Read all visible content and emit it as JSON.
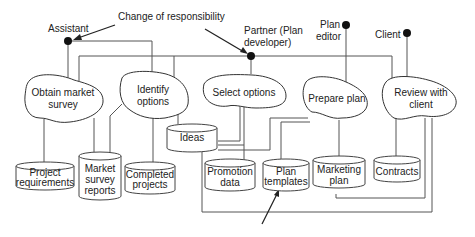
{
  "diagram": {
    "annotations": {
      "change_of_responsibility": "Change of responsibility"
    },
    "roles": [
      {
        "id": "assistant",
        "lines": [
          "Assistant"
        ]
      },
      {
        "id": "partner",
        "lines": [
          "Partner (Plan",
          "developer)"
        ]
      },
      {
        "id": "plan_editor",
        "lines": [
          "Plan",
          "editor"
        ]
      },
      {
        "id": "client",
        "lines": [
          "Client"
        ]
      }
    ],
    "activities": [
      {
        "id": "obtain_market_survey",
        "lines": [
          "Obtain market",
          "survey"
        ]
      },
      {
        "id": "identify_options",
        "lines": [
          "Identify",
          "options"
        ]
      },
      {
        "id": "select_options",
        "lines": [
          "Select options"
        ]
      },
      {
        "id": "prepare_plan",
        "lines": [
          "Prepare plan"
        ]
      },
      {
        "id": "review_with_client",
        "lines": [
          "Review with",
          "client"
        ]
      }
    ],
    "stores": [
      {
        "id": "project_requirements",
        "lines": [
          "Project",
          "requirements"
        ]
      },
      {
        "id": "market_survey_reports",
        "lines": [
          "Market",
          "survey",
          "reports"
        ]
      },
      {
        "id": "completed_projects",
        "lines": [
          "Completed",
          "projects"
        ]
      },
      {
        "id": "ideas",
        "lines": [
          "Ideas"
        ]
      },
      {
        "id": "promotion_data",
        "lines": [
          "Promotion",
          "data"
        ]
      },
      {
        "id": "plan_templates",
        "lines": [
          "Plan",
          "templates"
        ]
      },
      {
        "id": "marketing_plan",
        "lines": [
          "Marketing",
          "plan"
        ]
      },
      {
        "id": "contracts",
        "lines": [
          "Contracts"
        ]
      }
    ]
  }
}
